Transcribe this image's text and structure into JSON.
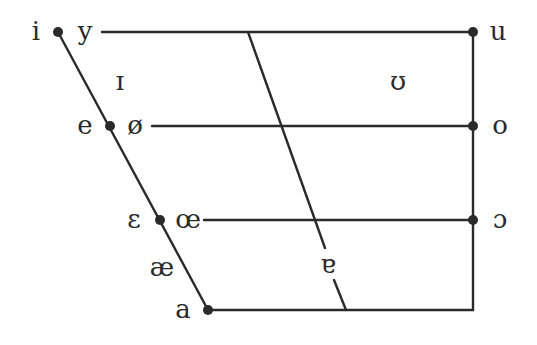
{
  "diagram": {
    "type": "IPA vowel chart",
    "line_color": "#2a2a2a",
    "vowels": {
      "i": "i",
      "y": "y",
      "u": "u",
      "small_i": "ɪ",
      "upsilon": "ʊ",
      "e": "e",
      "o_slash": "ø",
      "o": "o",
      "epsilon": "ɛ",
      "oe": "œ",
      "open_o": "ɔ",
      "ae": "æ",
      "turned_a": "ɐ",
      "a": "a"
    }
  }
}
